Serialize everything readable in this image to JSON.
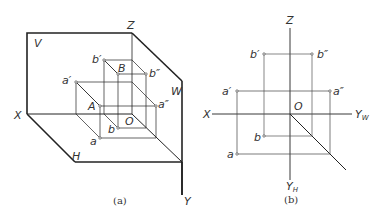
{
  "figure_a": {
    "caption": "(a)",
    "planes": {
      "V": "V",
      "H": "H",
      "W": "W"
    },
    "axes": {
      "X": "X",
      "Y": "Y",
      "Z": "Z"
    },
    "origin": "O",
    "points": {
      "A": "A",
      "B": "B",
      "a": "a",
      "a_prime": "a′",
      "a_double_prime": "a″",
      "b": "b",
      "b_prime": "b′",
      "b_double_prime": "b″"
    }
  },
  "figure_b": {
    "caption": "(b)",
    "axes": {
      "X": "X",
      "Z": "Z",
      "YW_main": "Y",
      "YW_sub": "W",
      "YH_main": "Y",
      "YH_sub": "H"
    },
    "origin": "O",
    "points": {
      "a": "a",
      "a_prime": "a′",
      "a_double_prime": "a″",
      "b": "b",
      "b_prime": "b′",
      "b_double_prime": "b″"
    }
  }
}
